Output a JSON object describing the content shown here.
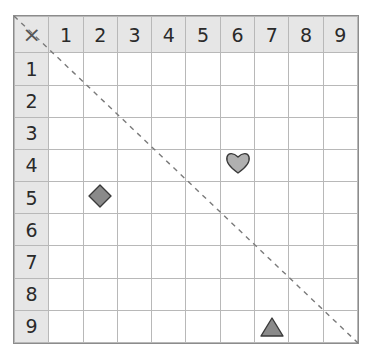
{
  "corner_symbol": "×",
  "column_headers": [
    "1",
    "2",
    "3",
    "4",
    "5",
    "6",
    "7",
    "8",
    "9"
  ],
  "row_headers": [
    "1",
    "2",
    "3",
    "4",
    "5",
    "6",
    "7",
    "8",
    "9"
  ],
  "diagonal": {
    "style": "dashed",
    "from": "top-left",
    "to": "bottom-right"
  },
  "shapes": [
    {
      "type": "heart-icon",
      "row": 4,
      "col": 6,
      "color": "#b0b0b0"
    },
    {
      "type": "diamond-icon",
      "row": 5,
      "col": 2,
      "color": "#8a8a8a"
    },
    {
      "type": "triangle-icon",
      "row": 9,
      "col": 7,
      "color": "#8a8a8a"
    }
  ],
  "colors": {
    "header_bg": "#e6e6e6",
    "grid_line": "#b8b8b8",
    "border": "#8c8c8c"
  }
}
